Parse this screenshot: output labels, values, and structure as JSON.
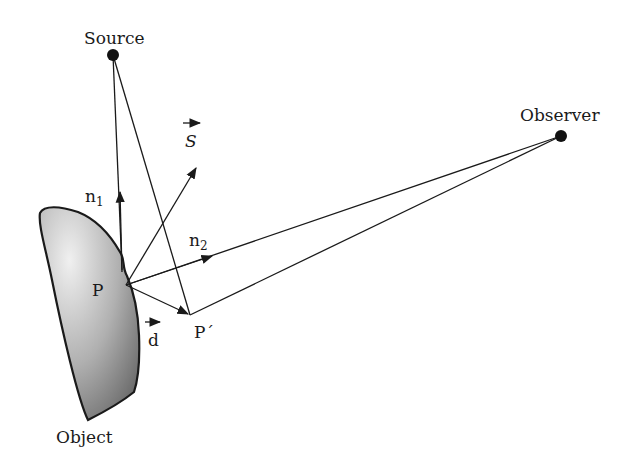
{
  "diagram": {
    "labels": {
      "source": "Source",
      "observer": "Observer",
      "object": "Object",
      "p": "P",
      "p_prime": "P´",
      "n1": "n",
      "n1_sub": "1",
      "n2": "n",
      "n2_sub": "2",
      "s": "S",
      "d": "d"
    },
    "points": {
      "source": [
        113,
        55
      ],
      "observer": [
        561,
        136
      ],
      "p": [
        126,
        285
      ],
      "p_prime": [
        190,
        315
      ]
    },
    "colors": {
      "line": "#1a1a1a",
      "object_fill_light": "#e8e8e8",
      "object_fill_dark": "#7a7a7a"
    }
  }
}
